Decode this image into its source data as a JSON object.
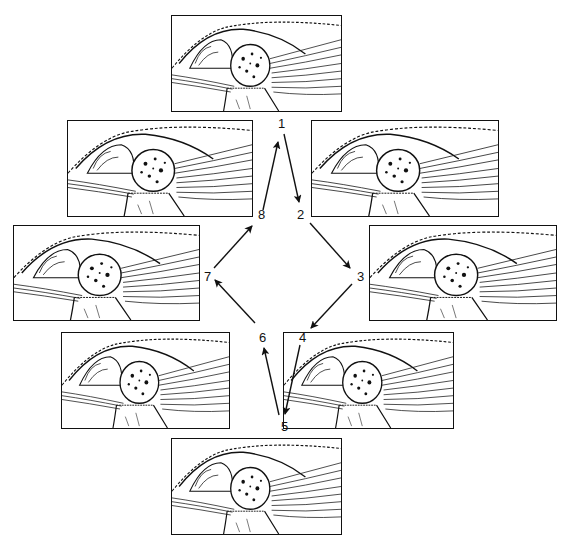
{
  "diagram": {
    "type": "cycle",
    "stages": [
      {
        "number": "1",
        "panel": "top"
      },
      {
        "number": "2",
        "panel": "upper-right"
      },
      {
        "number": "3",
        "panel": "middle-right"
      },
      {
        "number": "4",
        "panel": "lower-right"
      },
      {
        "number": "5",
        "panel": "bottom"
      },
      {
        "number": "6",
        "panel": "lower-left"
      },
      {
        "number": "7",
        "panel": "middle-left"
      },
      {
        "number": "8",
        "panel": "upper-left"
      }
    ],
    "arrows": [
      {
        "from": "1",
        "to": "2"
      },
      {
        "from": "2",
        "to": "3"
      },
      {
        "from": "3",
        "to": "4"
      },
      {
        "from": "4",
        "to": "5"
      },
      {
        "from": "5",
        "to": "6"
      },
      {
        "from": "6",
        "to": "7"
      },
      {
        "from": "7",
        "to": "8"
      },
      {
        "from": "8",
        "to": "1"
      }
    ]
  },
  "colors": {
    "ink": "#111111",
    "background": "#ffffff"
  }
}
